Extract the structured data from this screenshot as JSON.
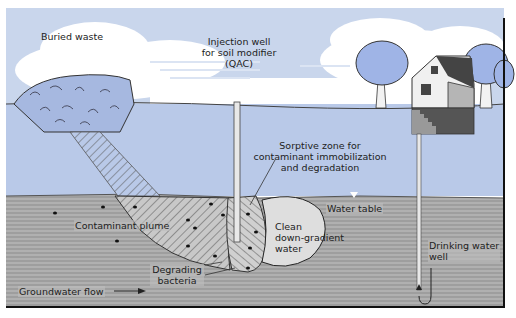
{
  "diagram": {
    "colors": {
      "sky": "#c9d6ec",
      "cloud": "#ffffff",
      "unsaturated_soil": "#b9c9e8",
      "saturated_zone": "#a8a8a8",
      "saturated_lines": "#8a8a8a",
      "waste": "#a6b8e0",
      "plume_hatch": "#555555",
      "clean_water": "#d9d9d9",
      "tree_foliage": "#9fb4e6",
      "house_wall": "#f0f0f0",
      "house_roof": "#444444",
      "frame": "#111111"
    },
    "labels": {
      "buried_waste": "Buried waste",
      "injection_well_line1": "Injection well",
      "injection_well_line2": "for soil modifier",
      "injection_well_line3": "(QAC)",
      "sorptive_zone_line1": "Sorptive zone for",
      "sorptive_zone_line2": "contaminant immobilization",
      "sorptive_zone_line3": "and degradation",
      "water_table": "Water table",
      "contaminant_plume": "Contaminant plume",
      "clean_line1": "Clean",
      "clean_line2": "down-gradient",
      "clean_line3": "water",
      "drinking_line1": "Drinking water",
      "drinking_line2": "well",
      "degrading_line1": "Degrading",
      "degrading_line2": "bacteria",
      "groundwater_flow": "Groundwater flow"
    },
    "icons": {
      "water_table_marker": "triangle-down-icon",
      "flow_arrow": "arrow-right-icon",
      "well_arrow": "arrow-up-icon"
    }
  }
}
